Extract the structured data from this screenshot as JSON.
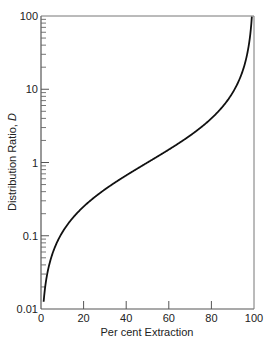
{
  "chart_data": {
    "type": "line",
    "title": "",
    "xlabel": "Per cent Extraction",
    "ylabel": "Distribution Ratio, D",
    "ylabel_main": "Distribution Ratio, ",
    "ylabel_italic": "D",
    "xlim": [
      0,
      100
    ],
    "ylim": [
      0.01,
      100
    ],
    "yscale": "log",
    "grid": false,
    "legend": "none",
    "x_ticks": [
      0,
      20,
      40,
      60,
      80,
      100
    ],
    "x_tick_labels": [
      "0",
      "20",
      "40",
      "60",
      "80",
      "100"
    ],
    "y_ticks": [
      0.01,
      0.1,
      1,
      10,
      100
    ],
    "y_tick_labels": [
      "0.01",
      "0.1",
      "1",
      "10",
      "100"
    ],
    "series": [
      {
        "name": "D = E/(100 - E)",
        "color": "#111111",
        "x": [
          0.99,
          2,
          3,
          5,
          8,
          10,
          15,
          20,
          25,
          30,
          40,
          50,
          60,
          70,
          75,
          80,
          85,
          90,
          93,
          95,
          97,
          98,
          99
        ],
        "y": [
          0.01,
          0.0204,
          0.0309,
          0.0526,
          0.087,
          0.111,
          0.176,
          0.25,
          0.333,
          0.429,
          0.667,
          1.0,
          1.5,
          2.33,
          3.0,
          4.0,
          5.67,
          9.0,
          13.3,
          19.0,
          32.3,
          49.0,
          99.0
        ]
      }
    ]
  }
}
